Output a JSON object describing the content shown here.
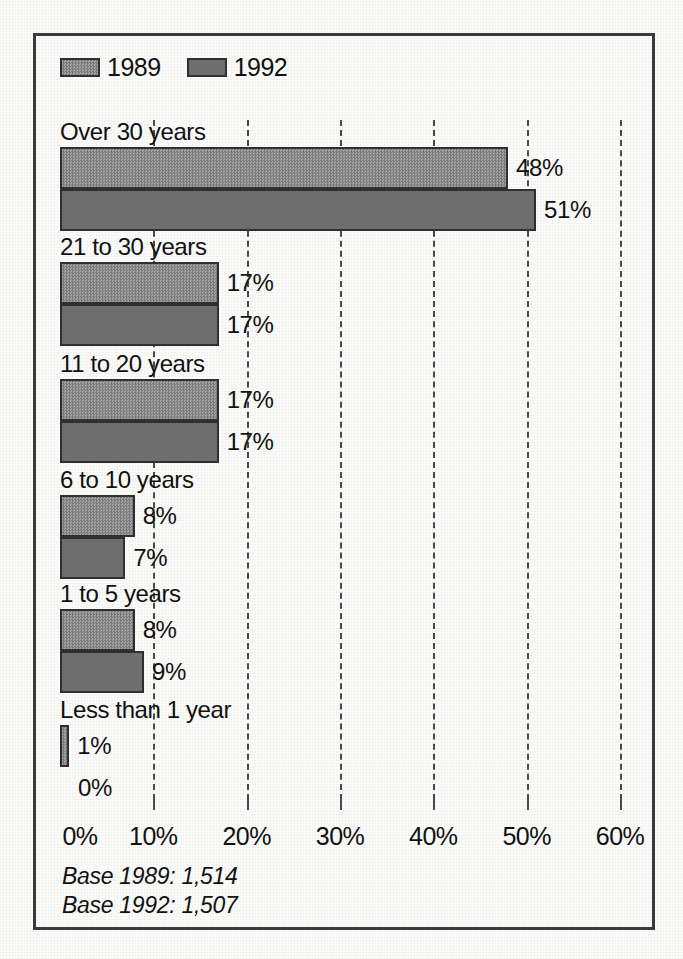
{
  "legend": {
    "entries": [
      {
        "label": "1989",
        "swatch": "light-gray-dither",
        "color": "#8d8d8d"
      },
      {
        "label": "1992",
        "swatch": "dark-gray-solid",
        "color": "#6e6e6e"
      }
    ]
  },
  "notes": {
    "base_1989": "Base 1989: 1,514",
    "base_1992": "Base 1992: 1,507"
  },
  "axis": {
    "ticks": [
      "0%",
      "10%",
      "20%",
      "30%",
      "40%",
      "50%",
      "60%"
    ],
    "tick_values": [
      0,
      10,
      20,
      30,
      40,
      50,
      60
    ]
  },
  "chart_data": {
    "type": "bar",
    "orientation": "horizontal",
    "title": "",
    "subtitle": "",
    "xlabel": "",
    "ylabel": "",
    "xlim": [
      0,
      60
    ],
    "xtick_labels": [
      "0%",
      "10%",
      "20%",
      "30%",
      "40%",
      "50%",
      "60%"
    ],
    "grid": "vertical-dashed",
    "legend_position": "top-left",
    "categories": [
      "Over 30 years",
      "21 to 30 years",
      "11 to 20 years",
      "6 to 10 years",
      "1 to 5 years",
      "Less than 1 year"
    ],
    "series": [
      {
        "name": "1989",
        "color": "#8d8d8d",
        "values": [
          48,
          17,
          17,
          8,
          8,
          1
        ],
        "labels": [
          "48%",
          "17%",
          "17%",
          "8%",
          "8%",
          "1%"
        ]
      },
      {
        "name": "1992",
        "color": "#6e6e6e",
        "values": [
          51,
          17,
          17,
          7,
          9,
          0
        ],
        "labels": [
          "51%",
          "17%",
          "17%",
          "7%",
          "9%",
          "0%"
        ]
      }
    ],
    "base_notes": [
      "Base 1989: 1,514",
      "Base 1992: 1,507"
    ]
  }
}
